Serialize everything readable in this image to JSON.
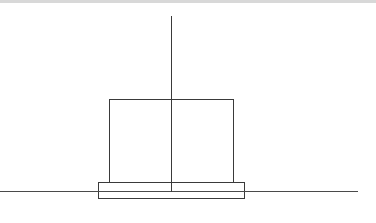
{
  "diagram": {
    "stroke_color": "#3a3a3a",
    "background": "#ffffff",
    "top_strip_color": "#d8d8d8",
    "elements": {
      "vertical_axis": {
        "x": 171.5,
        "y1": 16,
        "y2": 192
      },
      "ground_line": {
        "x1": 0,
        "x2": 358,
        "y": 191.5
      },
      "upper_box": {
        "x": 109.5,
        "y": 99.5,
        "width": 124,
        "height": 83
      },
      "base_plate": {
        "x": 98.5,
        "y": 182.5,
        "width": 146,
        "height": 16
      }
    }
  }
}
